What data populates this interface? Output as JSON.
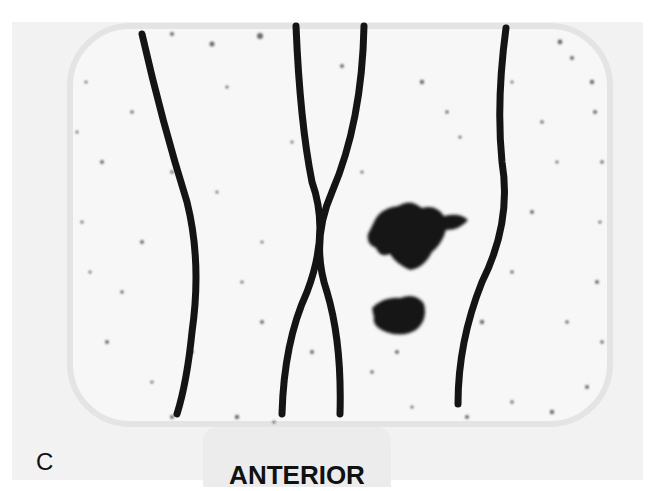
{
  "figure": {
    "panel_letter": "C",
    "view_label": "ANTERIOR",
    "colors": {
      "background": "#ffffff",
      "field": "#f2f2f2",
      "scan_area": "#f7f7f7",
      "ink": "#141414"
    }
  }
}
